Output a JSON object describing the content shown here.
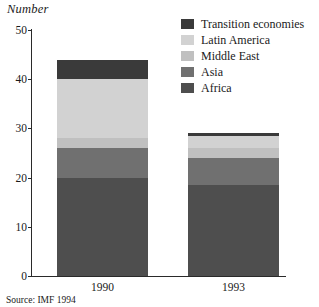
{
  "chart_data": {
    "type": "bar",
    "subtype": "stacked",
    "title": "",
    "ylabel": "Number",
    "xlabel": "",
    "categories": [
      "1990",
      "1993"
    ],
    "ylim": [
      0,
      50
    ],
    "yticks": [
      0,
      10,
      20,
      30,
      40,
      50
    ],
    "ytick_labels": [
      "0",
      "10",
      "20",
      "30",
      "40",
      "50"
    ],
    "grid": false,
    "legend_position": "top-right",
    "stack_order_bottom_to_top": [
      "Africa",
      "Asia",
      "Middle East",
      "Latin America",
      "Transition economies"
    ],
    "series": [
      {
        "name": "Transition economies",
        "color": "#3a3a3a",
        "values": [
          4,
          0.5
        ]
      },
      {
        "name": "Latin America",
        "color": "#d2d2d2",
        "values": [
          12,
          2.5
        ]
      },
      {
        "name": "Middle East",
        "color": "#c0c0c0",
        "values": [
          2,
          2
        ]
      },
      {
        "name": "Asia",
        "color": "#707070",
        "values": [
          6,
          5.5
        ]
      },
      {
        "name": "Africa",
        "color": "#4e4e4e",
        "values": [
          20,
          18.5
        ]
      }
    ],
    "totals": [
      44,
      29
    ],
    "source_note": "Source: IMF 1994"
  },
  "axis": {
    "ylabel": "Number",
    "ytick_labels": [
      "50",
      "40",
      "30",
      "20",
      "10",
      "0"
    ],
    "xtick_labels": [
      "1990",
      "1993"
    ]
  },
  "legend": {
    "items": [
      {
        "label": "Transition economies",
        "color": "#3a3a3a"
      },
      {
        "label": "Latin America",
        "color": "#d2d2d2"
      },
      {
        "label": "Middle East",
        "color": "#c0c0c0"
      },
      {
        "label": "Asia",
        "color": "#707070"
      },
      {
        "label": "Africa",
        "color": "#4e4e4e"
      }
    ]
  },
  "footer": {
    "source": "Source: IMF 1994"
  }
}
